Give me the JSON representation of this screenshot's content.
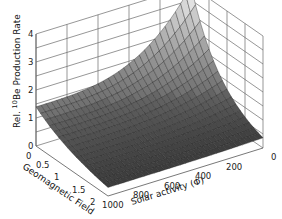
{
  "chart_data": {
    "type": "surface3d",
    "title": "",
    "xlabel": "Geomagnetic Field",
    "ylabel": "Solar activity (Φ)",
    "zlabel": "Rel. 10Be Production Rate",
    "zlabel_parts": {
      "prefix": "Rel. ",
      "superscript": "10",
      "suffix": "Be Production Rate"
    },
    "x_ticks": [
      "0",
      "0.5",
      "1",
      "1.5",
      "2"
    ],
    "x_values": [
      0,
      0.5,
      1,
      1.5,
      2
    ],
    "y_ticks": [
      "1000",
      "800",
      "600",
      "400",
      "200",
      "0"
    ],
    "y_values": [
      1000,
      800,
      600,
      400,
      200,
      0
    ],
    "z_ticks": [
      "0",
      "1",
      "2",
      "3",
      "4"
    ],
    "xlim": [
      0,
      2
    ],
    "ylim": [
      1000,
      0
    ],
    "zlim": [
      0,
      4
    ],
    "grid": true,
    "colormap": "gray",
    "surface_description": "Production rate decreases with increasing geomagnetic field and increasing solar activity; maximum ~4.0 at field 0 and Φ 0, ~1.4 at field 0 and Φ 1000, ~0.3 at field 2.",
    "surface_samples": {
      "geomagnetic_field": [
        0,
        0.5,
        1,
        1.5,
        2
      ],
      "solar_activity": [
        1000,
        800,
        600,
        400,
        200,
        0
      ],
      "values": [
        [
          1.4,
          1.55,
          1.75,
          2.05,
          2.6,
          4.0
        ],
        [
          1.05,
          1.15,
          1.28,
          1.45,
          1.75,
          2.3
        ],
        [
          0.75,
          0.8,
          0.88,
          0.98,
          1.1,
          1.35
        ],
        [
          0.5,
          0.53,
          0.57,
          0.62,
          0.68,
          0.78
        ],
        [
          0.3,
          0.32,
          0.34,
          0.36,
          0.38,
          0.42
        ]
      ]
    }
  }
}
